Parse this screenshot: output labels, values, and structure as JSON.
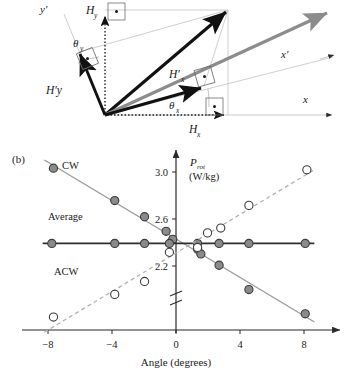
{
  "figure": {
    "panel_b_tag": "(b)",
    "panel_a_tag": ""
  },
  "diagram": {
    "name": "vector-decomposition-diagram",
    "labels": {
      "y_prime": "y′",
      "x_prime": "x′",
      "x": "x",
      "H_y": "H",
      "H_y_sub": "y",
      "H_x": "H",
      "H_x_sub": "x",
      "Hp_y": "H′y",
      "Hp_x": "H′",
      "Hp_x_sub": "x",
      "theta_y": "θ",
      "theta_y_sub": "y",
      "theta_x": "θ",
      "theta_x_sub": "x"
    },
    "colors": {
      "vector_black": "#111111",
      "vector_gray": "#8c8c8c",
      "construction_gray": "#b4b4b4",
      "axis_gray": "#c8c8c8"
    }
  },
  "chart_data": {
    "type": "scatter",
    "title": "",
    "xlabel": "Angle (degrees)",
    "ylabel": "P_rot (W/kg)",
    "ylabel_main": "P",
    "ylabel_sub": "rot",
    "ylabel_units": "(W/kg)",
    "xlim": [
      -9.6,
      9.6
    ],
    "ylim": [
      2.02,
      3.12
    ],
    "xticks": [
      -8,
      -4,
      0,
      4,
      8
    ],
    "xtick_labels": [
      "−8",
      "−4",
      "0",
      "4",
      "8"
    ],
    "yticks": [
      2.2,
      2.6,
      3.0
    ],
    "ytick_labels": [
      "2.2",
      "2.6",
      "3.0"
    ],
    "grid": false,
    "axis_break": true,
    "legend_position": "inline-annotations",
    "series": [
      {
        "name": "CW",
        "label": "CW",
        "marker": "filled-circle",
        "color": "#8a8a8a",
        "edge": "#3c3c3c",
        "line": "solid",
        "line_color": "#9a9a9a",
        "x": [
          -7.7,
          -4.0,
          -2.2,
          -0.9,
          -0.5,
          1.0,
          1.2,
          2.3,
          4.1,
          7.5
        ],
        "y": [
          3.02,
          2.82,
          2.72,
          2.63,
          2.58,
          2.52,
          2.49,
          2.42,
          2.27,
          2.12
        ]
      },
      {
        "name": "Average",
        "label": "Average",
        "marker": "filled-circle",
        "color": "#8a8a8a",
        "edge": "#3c3c3c",
        "line": "solid",
        "line_color": "#2e2e2e",
        "x": [
          -7.8,
          -4.0,
          -2.2,
          -0.7,
          1.0,
          2.3,
          4.1,
          7.5
        ],
        "y": [
          2.555,
          2.555,
          2.555,
          2.555,
          2.555,
          2.555,
          2.555,
          2.555
        ]
      },
      {
        "name": "ACW",
        "label": "ACW",
        "marker": "open-circle",
        "color": "#ffffff",
        "edge": "#3c3c3c",
        "line": "dashed",
        "line_color": "#b0b0b0",
        "x": [
          -7.7,
          -4.0,
          -2.2,
          -0.7,
          1.0,
          1.6,
          2.4,
          4.1,
          7.6
        ],
        "y": [
          2.1,
          2.24,
          2.32,
          2.5,
          2.53,
          2.62,
          2.65,
          2.79,
          3.01
        ]
      }
    ]
  }
}
